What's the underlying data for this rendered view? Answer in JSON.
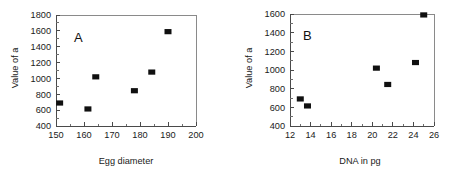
{
  "figure": {
    "background_color": "#ffffff",
    "marker_color": "#101010",
    "axis_color": "#4a4a4a"
  },
  "panel_a": {
    "letter": "A",
    "xlabel": "Egg diameter",
    "ylabel": "Value of a",
    "xticks": [
      "150",
      "160",
      "170",
      "180",
      "190",
      "200"
    ],
    "yticks": [
      "1800",
      "1600",
      "1400",
      "1200",
      "1000",
      "800",
      "600",
      "400"
    ]
  },
  "panel_b": {
    "letter": "B",
    "xlabel": "DNA in pg",
    "ylabel": "Value of a",
    "xticks": [
      "12",
      "14",
      "16",
      "18",
      "20",
      "22",
      "24",
      "26"
    ],
    "yticks": [
      "1600",
      "1400",
      "1200",
      "1000",
      "800",
      "600",
      "400"
    ]
  },
  "chart_data": [
    {
      "type": "scatter",
      "title": "A",
      "xlabel": "Egg diameter",
      "ylabel": "Value of a",
      "xlim": [
        150,
        200
      ],
      "ylim": [
        400,
        1800
      ],
      "xticks": [
        150,
        160,
        170,
        180,
        190,
        200
      ],
      "xticks_minor": [
        155,
        165,
        175,
        185,
        195
      ],
      "yticks": [
        400,
        600,
        800,
        1000,
        1200,
        1400,
        1600,
        1800
      ],
      "yticks_minor": [
        500,
        700,
        900,
        1100,
        1300,
        1500,
        1700
      ],
      "grid": false,
      "legend": null,
      "marker": "filled-square",
      "x": [
        151.3,
        161.4,
        164.2,
        178.0,
        184.2,
        190.0
      ],
      "y": [
        690,
        615,
        1020,
        845,
        1080,
        1590
      ]
    },
    {
      "type": "scatter",
      "title": "B",
      "xlabel": "DNA in pg",
      "ylabel": "Value of a",
      "xlim": [
        12,
        26
      ],
      "ylim": [
        400,
        1600
      ],
      "xticks": [
        12,
        14,
        16,
        18,
        20,
        22,
        24,
        26
      ],
      "xticks_minor": [
        13,
        15,
        17,
        19,
        21,
        23,
        25
      ],
      "yticks": [
        400,
        600,
        800,
        1000,
        1200,
        1400,
        1600
      ],
      "yticks_minor": [
        500,
        700,
        900,
        1100,
        1300,
        1500
      ],
      "grid": false,
      "legend": null,
      "marker": "filled-square",
      "x": [
        13.0,
        13.7,
        20.4,
        21.5,
        24.2,
        25.0
      ],
      "y": [
        690,
        615,
        1020,
        845,
        1080,
        1590
      ]
    }
  ]
}
